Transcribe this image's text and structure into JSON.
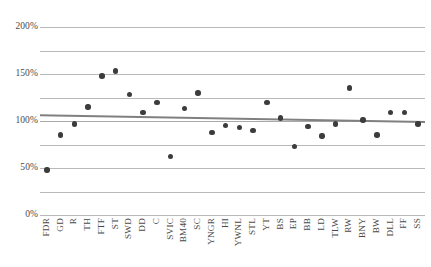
{
  "chart_data": {
    "type": "scatter",
    "title": "",
    "subtitle": "",
    "xlabel": "",
    "ylabel": "",
    "ylim": [
      0,
      200
    ],
    "ytick_labels": [
      "200%",
      "150%",
      "100%",
      "50%",
      "0%"
    ],
    "ytick_values": [
      200,
      150,
      100,
      50,
      0
    ],
    "gridlines": {
      "major_values": [
        100
      ],
      "minor_values": [
        200,
        175,
        150,
        125,
        75,
        50,
        25,
        0
      ],
      "visible": true,
      "color": "#b9b9b9",
      "major_color": "#a9a9a9"
    },
    "legend": {
      "visible": false,
      "position": "none"
    },
    "marker": {
      "shape": "circle",
      "color": "#3c3c3c",
      "size": 5.4
    },
    "categories": [
      "FDR",
      "GD",
      "R",
      "TH",
      "FTF",
      "ST",
      "SWD",
      "DD",
      "C",
      "SVIC",
      "BM40",
      "SC",
      "YNGR",
      "HI",
      "YWNL",
      "STL",
      "YT",
      "BS",
      "EP",
      "BB",
      "LD",
      "TLW",
      "RW",
      "BNY",
      "BW",
      "DLL",
      "FF",
      "SS"
    ],
    "values": [
      48,
      85,
      97,
      115,
      148,
      153,
      128,
      109,
      120,
      62,
      113,
      130,
      88,
      95,
      93,
      90,
      120,
      103,
      73,
      94,
      84,
      97,
      135,
      101,
      85,
      109,
      109,
      97
    ],
    "series": [
      {
        "name": "Series 1",
        "type": "scatter",
        "values": [
          48,
          85,
          97,
          115,
          148,
          153,
          128,
          109,
          120,
          62,
          113,
          130,
          88,
          95,
          93,
          90,
          120,
          103,
          73,
          94,
          84,
          97,
          135,
          101,
          85,
          109,
          109,
          97
        ]
      },
      {
        "name": "Linear trendline",
        "type": "line",
        "color": "#808080",
        "start_value": 106,
        "end_value": 99
      }
    ]
  }
}
